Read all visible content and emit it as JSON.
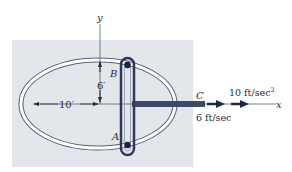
{
  "diagram": {
    "axes": {
      "x_label": "x",
      "y_label": "y"
    },
    "points": {
      "A": "A",
      "B": "B",
      "C": "C"
    },
    "dimensions": {
      "semi_major": "10′",
      "semi_minor": "6′"
    },
    "motion": {
      "velocity": "6 ft/sec",
      "acceleration": "10 ft/sec",
      "acceleration_exp": "2"
    },
    "colors": {
      "background": "#e3e7ec",
      "slot_outline": "#2f3a58",
      "rod": "#3e4a68",
      "pin": "#1a2240",
      "ellipse_track": "#ffffff"
    }
  }
}
